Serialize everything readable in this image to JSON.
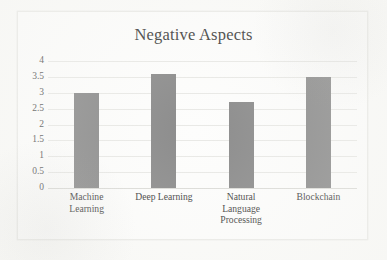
{
  "chart_data": {
    "type": "bar",
    "title": "Negative Aspects",
    "xlabel": "",
    "ylabel": "",
    "categories": [
      "Machine Learning",
      "Deep Learning",
      "Natural Language Processing",
      "Blockchain"
    ],
    "category_lines": [
      [
        "Machine",
        "Learning"
      ],
      [
        "Deep Learning"
      ],
      [
        "Natural",
        "Language",
        "Processing"
      ],
      [
        "Blockchain"
      ]
    ],
    "values": [
      3,
      3.6,
      2.7,
      3.5
    ],
    "ylim": [
      0,
      4
    ],
    "ytick_labels": [
      "0",
      "0.5",
      "1",
      "1.5",
      "2",
      "2.5",
      "3",
      "3.5",
      "4"
    ],
    "ytick_values": [
      0,
      0.5,
      1,
      1.5,
      2,
      2.5,
      3,
      3.5,
      4
    ],
    "grid": true,
    "legend": false,
    "legend_position": "none",
    "bar_color": "#8c8c8c",
    "gridline_color": "#e9e9e6",
    "title_color": "#3d3d3d",
    "tick_label_color": "#585858",
    "frame_color": "#ebebe8",
    "background_color": "#fdfdfc"
  }
}
